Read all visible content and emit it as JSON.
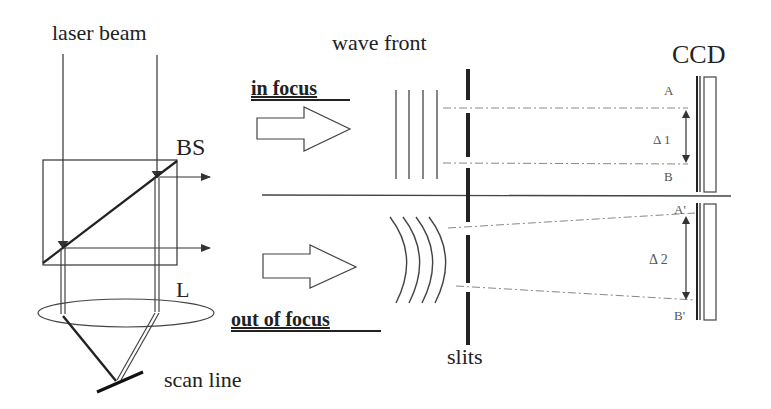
{
  "labels": {
    "laser_beam": "laser beam",
    "beam_splitter": "BS",
    "lens": "L",
    "scan_line": "scan line",
    "in_focus": "in focus",
    "out_of_focus": "out of focus",
    "wave_front": "wave front",
    "slits": "slits",
    "ccd": "CCD",
    "point_a": "A",
    "point_b": "B",
    "point_a_prime": "A'",
    "point_b_prime": "B'",
    "delta_1": "Δ 1",
    "delta_2": "Δ 2"
  },
  "colors": {
    "stroke": "#333333",
    "light_stroke": "#666666",
    "dash_stroke": "#888888",
    "background": "#ffffff"
  }
}
